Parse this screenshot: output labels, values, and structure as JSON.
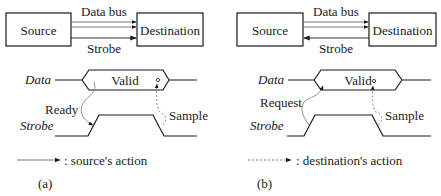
{
  "panels": [
    {
      "id": "a",
      "caption": "(a)",
      "source_label": "Source",
      "destination_label": "Destination",
      "data_bus_label": "Data bus",
      "strobe_label": "Strobe",
      "strobe_direction": "source-to-destination",
      "timing": {
        "data_signal": "Data",
        "strobe_signal": "Strobe",
        "valid_label": "Valid",
        "first_action": "Ready",
        "second_action": "Sample"
      },
      "legend": {
        "line_style": "solid",
        "text": ": source's action"
      }
    },
    {
      "id": "b",
      "caption": "(b)",
      "source_label": "Source",
      "destination_label": "Destination",
      "data_bus_label": "Data bus",
      "strobe_label": "Strobe",
      "strobe_direction": "destination-to-source",
      "timing": {
        "data_signal": "Data",
        "strobe_signal": "Strobe",
        "valid_label": "Valid",
        "first_action": "Request",
        "second_action": "Sample"
      },
      "legend": {
        "line_style": "dashed",
        "text": ": destination's action"
      }
    }
  ],
  "colors": {
    "line": "#1a1a1a",
    "thin": "#555555",
    "background": "#ffffff"
  }
}
